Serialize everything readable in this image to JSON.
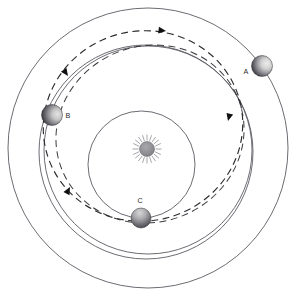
{
  "diagram": {
    "type": "orbital-trajectory-schematic",
    "background_color": "#ffffff",
    "canvas": {
      "width": 299,
      "height": 308
    },
    "center": {
      "x": 147,
      "y": 149
    },
    "star": {
      "name": "sun",
      "label": "",
      "x": 147,
      "y": 149,
      "radius": 7.5,
      "ray_count": 20,
      "ray_inner": 8.5,
      "ray_outer": 14.5,
      "body_color": "#8a8a90",
      "ray_color": "#8f8f96"
    },
    "orbits": [
      {
        "id": "orbit-c",
        "name": "inner-orbit-c",
        "belongs_to": "C",
        "cx": 141.5,
        "cy": 164.5,
        "r": 53.5,
        "stroke": "#5b5b63",
        "style": "solid"
      },
      {
        "id": "orbit-b",
        "name": "middle-orbit-b",
        "belongs_to": "B",
        "cx": 148,
        "cy": 150,
        "r": 104,
        "stroke": "#5b5b63",
        "style": "solid"
      },
      {
        "id": "orbit-a",
        "name": "outer-orbit-a",
        "belongs_to": "A",
        "cx": 146,
        "cy": 152,
        "r": 107,
        "stroke": "#5b5b63",
        "style": "solid"
      },
      {
        "id": "orbit-outermost",
        "name": "outermost-orbit",
        "belongs_to": "",
        "cx": 148,
        "cy": 148,
        "r": 140,
        "stroke": "#5b5b63",
        "style": "solid"
      }
    ],
    "transfer_trajectory": {
      "id": "transfer-ellipse",
      "name": "dashed-transfer-orbit",
      "style": "dashed",
      "stroke": "#2b2b30",
      "dash": "7 4.5",
      "cx": 143,
      "cy": 126,
      "rx": 100,
      "ry": 95,
      "rotation_deg": -14
    },
    "planets": [
      {
        "id": "planet-a",
        "label": "A",
        "x": 262,
        "y": 66,
        "r": 10.5,
        "label_x": 246,
        "label_y": 74,
        "lit_side": "right",
        "light_color": "#d8d8d8",
        "dark_color": "#3a3a3f"
      },
      {
        "id": "planet-b",
        "label": "B",
        "x": 52,
        "y": 115,
        "r": 10.5,
        "label_x": 68,
        "label_y": 118,
        "lit_side": "right",
        "light_color": "#d0d0d0",
        "dark_color": "#36363b"
      },
      {
        "id": "planet-c",
        "label": "C",
        "x": 141,
        "y": 218,
        "r": 10,
        "label_x": 140,
        "label_y": 203,
        "lit_side": "top",
        "light_color": "#bdbdbd",
        "dark_color": "#3f3f44"
      }
    ],
    "direction_arrows": [
      {
        "id": "arrow-top",
        "name": "arrow-top-leftward",
        "x": 166,
        "y": 31,
        "angle_deg": 187
      },
      {
        "id": "arrow-upper-left",
        "name": "arrow-upper-left",
        "x": 68,
        "y": 76,
        "angle_deg": 235
      },
      {
        "id": "arrow-lower-left",
        "name": "arrow-lower-left",
        "x": 70,
        "y": 187,
        "angle_deg": 118
      },
      {
        "id": "arrow-right",
        "name": "arrow-right-upward",
        "x": 228,
        "y": 121,
        "angle_deg": 284
      }
    ]
  }
}
